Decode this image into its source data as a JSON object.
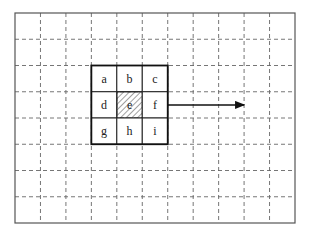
{
  "grid": {
    "columns": 11,
    "rows": 8,
    "line_style": "dashed",
    "border_color": "#444444"
  },
  "window": {
    "start_col": 3,
    "start_row": 2,
    "size": 3,
    "cells": [
      {
        "label": "a",
        "hatched": false
      },
      {
        "label": "b",
        "hatched": false
      },
      {
        "label": "c",
        "hatched": false
      },
      {
        "label": "d",
        "hatched": false
      },
      {
        "label": "e",
        "hatched": true
      },
      {
        "label": "f",
        "hatched": false
      },
      {
        "label": "g",
        "hatched": false
      },
      {
        "label": "h",
        "hatched": false
      },
      {
        "label": "i",
        "hatched": false
      }
    ]
  },
  "arrow": {
    "direction": "right",
    "length_cells": 3
  }
}
